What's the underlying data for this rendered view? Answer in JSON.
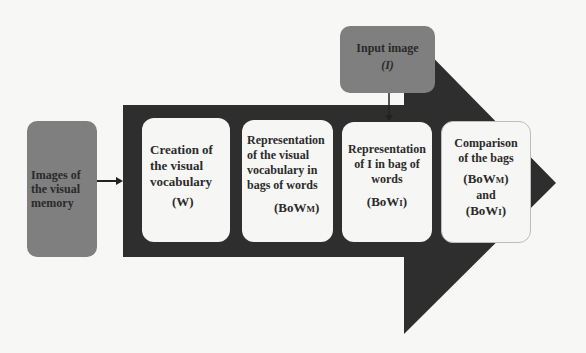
{
  "colors": {
    "background": "#f7f7f5",
    "arrow_body": "#2e2e2e",
    "gray_box": "#7f7f7f",
    "white_box": "#f6f6f4",
    "text": "#2b2b2b"
  },
  "source_box": {
    "lines": [
      "Images of",
      "the visual",
      "memory"
    ]
  },
  "input_box": {
    "lines": [
      "Input image",
      "(I)"
    ]
  },
  "steps": [
    {
      "lines": [
        "Creation of",
        "the visual",
        "vocabulary"
      ],
      "symbol": "(W)"
    },
    {
      "lines": [
        "Representation",
        "of the visual",
        "vocabulary in",
        "bags of words"
      ],
      "symbol_base": "(BoW",
      "symbol_sub": "M",
      "symbol_end": ")"
    },
    {
      "lines": [
        "Representation",
        "of I in bag of",
        "words"
      ],
      "symbol_base": "(BoW",
      "symbol_sub": "I",
      "symbol_end": ")"
    },
    {
      "lines": [
        "Comparison",
        "of the bags"
      ],
      "symbol1_base": "(BoW",
      "symbol1_sub": "M",
      "symbol1_end": ")",
      "connector": "and",
      "symbol2_base": "(BoW",
      "symbol2_sub": "I",
      "symbol2_end": ")"
    }
  ]
}
